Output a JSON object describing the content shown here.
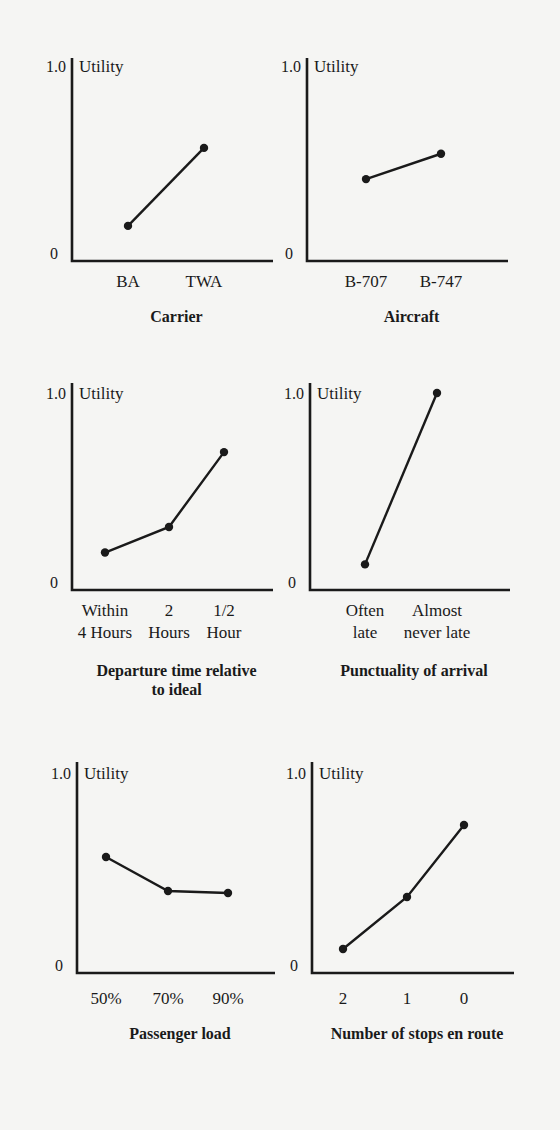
{
  "chart_data": [
    {
      "type": "line",
      "title": "Carrier",
      "ylabel": "Utility",
      "yticks": [
        "0",
        "1.0"
      ],
      "ylim": [
        0,
        1.0
      ],
      "categories": [
        "BA",
        "TWA"
      ],
      "values": [
        0.18,
        0.58
      ],
      "layout": {
        "ox": 72,
        "oy": 261,
        "ytop": 58,
        "xend": 273,
        "h": 195,
        "xs": [
          128,
          204
        ],
        "title_y": 322,
        "label_y": 287
      }
    },
    {
      "type": "line",
      "title": "Aircraft",
      "ylabel": "Utility",
      "yticks": [
        "0",
        "1.0"
      ],
      "ylim": [
        0,
        1.0
      ],
      "categories": [
        "B-707",
        "B-747"
      ],
      "values": [
        0.42,
        0.55
      ],
      "layout": {
        "ox": 307,
        "oy": 261,
        "ytop": 58,
        "xend": 508,
        "h": 195,
        "xs": [
          366,
          441
        ],
        "title_y": 322,
        "label_y": 287
      }
    },
    {
      "type": "line",
      "title": "Departure time relative to ideal",
      "title_lines": [
        "Departure time relative",
        "to ideal"
      ],
      "ylabel": "Utility",
      "yticks": [
        "0",
        "1.0"
      ],
      "ylim": [
        0,
        1.0
      ],
      "categories": [
        "Within 4 Hours",
        "2 Hours",
        "1/2 Hour"
      ],
      "category_lines": [
        [
          "Within",
          "4 Hours"
        ],
        [
          "2",
          "Hours"
        ],
        [
          "1/2",
          "Hour"
        ]
      ],
      "values": [
        0.19,
        0.32,
        0.7
      ],
      "layout": {
        "ox": 72,
        "oy": 590,
        "ytop": 383,
        "xend": 273,
        "h": 197,
        "xs": [
          105,
          169,
          224
        ],
        "title_y": 676,
        "label_y": 616
      }
    },
    {
      "type": "line",
      "title": "Punctuality of arrival",
      "ylabel": "Utility",
      "yticks": [
        "0",
        "1.0"
      ],
      "ylim": [
        0,
        1.0
      ],
      "categories": [
        "Often late",
        "Almost never late"
      ],
      "category_lines": [
        [
          "Often",
          "late"
        ],
        [
          "Almost",
          "never late"
        ]
      ],
      "values": [
        0.13,
        1.0
      ],
      "layout": {
        "ox": 310,
        "oy": 590,
        "ytop": 383,
        "xend": 510,
        "h": 197,
        "xs": [
          365,
          437
        ],
        "title_y": 676,
        "label_y": 616
      }
    },
    {
      "type": "line",
      "title": "Passenger load",
      "ylabel": "Utility",
      "yticks": [
        "0",
        "1.0"
      ],
      "ylim": [
        0,
        1.0
      ],
      "categories": [
        "50%",
        "70%",
        "90%"
      ],
      "values": [
        0.58,
        0.41,
        0.4
      ],
      "layout": {
        "ox": 77,
        "oy": 973,
        "ytop": 762,
        "xend": 275,
        "h": 200,
        "xs": [
          106,
          168,
          228
        ],
        "title_y": 1039,
        "label_y": 1004
      }
    },
    {
      "type": "line",
      "title": "Number of stops en route",
      "ylabel": "Utility",
      "yticks": [
        "0",
        "1.0"
      ],
      "ylim": [
        0,
        1.0
      ],
      "categories": [
        "2",
        "1",
        "0"
      ],
      "values": [
        0.12,
        0.38,
        0.74
      ],
      "layout": {
        "ox": 312,
        "oy": 973,
        "ytop": 762,
        "xend": 514,
        "h": 200,
        "xs": [
          343,
          407,
          464
        ],
        "title_y": 1039,
        "label_y": 1004
      }
    }
  ]
}
